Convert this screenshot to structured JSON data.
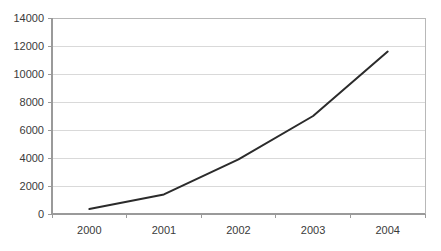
{
  "chart_data": {
    "type": "line",
    "title": "",
    "subtitle": "",
    "xlabel": "",
    "ylabel": "",
    "categories": [
      "2000",
      "2001",
      "2002",
      "2003",
      "2004"
    ],
    "series": [
      {
        "name": "Series 1",
        "values": [
          350,
          1400,
          3900,
          7000,
          11600
        ],
        "color": "#2b2b2b"
      }
    ],
    "ylim": [
      0,
      14000
    ],
    "ytick_values": [
      0,
      2000,
      4000,
      6000,
      8000,
      10000,
      12000,
      14000
    ],
    "ytick_labels": [
      "0",
      "2000",
      "4000",
      "6000",
      "8000",
      "10000",
      "12000",
      "14000"
    ],
    "grid": {
      "horizontal": true,
      "vertical": false,
      "color": "#d9d9d9"
    },
    "legend": {
      "visible": false,
      "position": "none"
    },
    "markers": false,
    "background_color": "#ffffff",
    "axis_color": "#9a9a9a"
  },
  "figure": {
    "plot_area": {
      "left": 52,
      "right": 425,
      "top": 18,
      "bottom": 214
    }
  }
}
